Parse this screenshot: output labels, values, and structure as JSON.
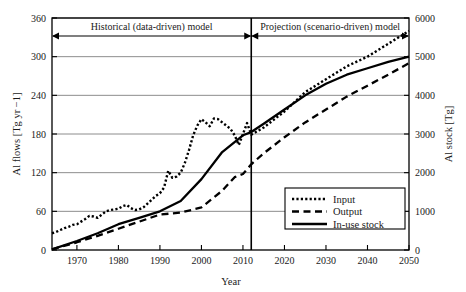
{
  "chart_data": {
    "type": "line",
    "title": "",
    "xlabel": "Year",
    "ylabel": "Al flows [Tg yr −1]",
    "y2label": "Al stock [Tg]",
    "xlim": [
      1964,
      2050
    ],
    "ylim": [
      0,
      360
    ],
    "y2lim": [
      0,
      6000
    ],
    "xticks": [
      1970,
      1980,
      1990,
      2000,
      2010,
      2020,
      2030,
      2040,
      2050
    ],
    "yticks": [
      0,
      60,
      120,
      180,
      240,
      300,
      360
    ],
    "y2ticks": [
      0,
      1000,
      2000,
      3000,
      4000,
      5000,
      6000
    ],
    "grid": true,
    "legend_position": "lower-right",
    "series": [
      {
        "name": "Input",
        "style": "dotted",
        "axis": "left",
        "x": [
          1964,
          1965,
          1966,
          1967,
          1968,
          1969,
          1970,
          1971,
          1972,
          1973,
          1974,
          1975,
          1976,
          1977,
          1978,
          1979,
          1980,
          1981,
          1982,
          1983,
          1984,
          1985,
          1986,
          1987,
          1988,
          1989,
          1990,
          1991,
          1992,
          1993,
          1994,
          1995,
          1996,
          1997,
          1998,
          1999,
          2000,
          2001,
          2002,
          2003,
          2004,
          2005,
          2006,
          2007,
          2008,
          2009,
          2010,
          2011,
          2012,
          2015,
          2020,
          2025,
          2030,
          2035,
          2040,
          2045,
          2050
        ],
        "values": [
          26,
          28,
          31,
          34,
          36,
          39,
          40,
          44,
          48,
          53,
          52,
          50,
          55,
          60,
          62,
          63,
          64,
          68,
          70,
          65,
          62,
          63,
          66,
          72,
          78,
          84,
          88,
          97,
          123,
          112,
          114,
          120,
          135,
          155,
          178,
          193,
          203,
          198,
          192,
          204,
          203,
          198,
          193,
          188,
          178,
          163,
          180,
          197,
          179,
          190,
          215,
          245,
          265,
          285,
          300,
          320,
          340
        ]
      },
      {
        "name": "Output",
        "style": "dashed",
        "axis": "left",
        "x": [
          1964,
          1970,
          1975,
          1980,
          1985,
          1990,
          1995,
          2000,
          2005,
          2008,
          2010,
          2012,
          2015,
          2020,
          2025,
          2030,
          2035,
          2040,
          2045,
          2050
        ],
        "values": [
          1,
          12,
          22,
          33,
          44,
          55,
          58,
          66,
          92,
          113,
          118,
          133,
          150,
          175,
          198,
          218,
          238,
          255,
          272,
          290
        ]
      },
      {
        "name": "In-use stock",
        "style": "solid",
        "axis": "right",
        "x": [
          1964,
          1970,
          1975,
          1980,
          1985,
          1990,
          1995,
          2000,
          2005,
          2010,
          2012,
          2015,
          2020,
          2025,
          2030,
          2035,
          2040,
          2045,
          2050
        ],
        "values_left_scale": [
          1,
          14,
          26,
          40,
          50,
          60,
          76,
          110,
          152,
          178,
          183,
          196,
          218,
          240,
          258,
          272,
          282,
          292,
          300
        ],
        "values": [
          17,
          233,
          433,
          667,
          833,
          1000,
          1267,
          1833,
          2533,
          2967,
          3050,
          3267,
          3633,
          4000,
          4300,
          4533,
          4700,
          4867,
          5000
        ]
      }
    ],
    "annotations": [
      {
        "name": "historical-span",
        "label": "Historical (data-driven) model",
        "x_start": 1964,
        "x_end": 2012
      },
      {
        "name": "projection-span",
        "label": "Projection (scenario-driven) model",
        "x_start": 2012,
        "x_end": 2050
      },
      {
        "name": "divider",
        "label": "",
        "x": 2012
      }
    ]
  },
  "legend": {
    "items": [
      {
        "label": "Input",
        "style": "dotted"
      },
      {
        "label": "Output",
        "style": "dashed"
      },
      {
        "label": "In-use stock",
        "style": "solid"
      }
    ]
  },
  "colors": {
    "line": "#000000",
    "grid": "#808080",
    "axis": "#000000",
    "background": "#ffffff"
  }
}
